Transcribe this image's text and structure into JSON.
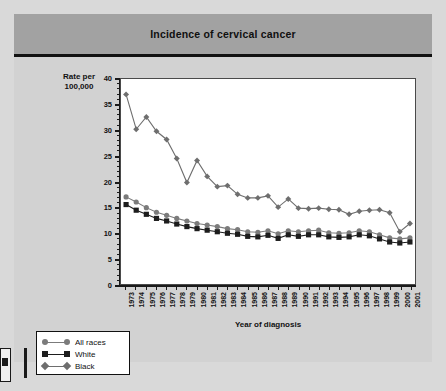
{
  "figure": {
    "title": "Incidence of cervical cancer",
    "title_bar_color": "#a2a2a2",
    "background_color": "#d9d9d9",
    "panel_color": "#d2d2d2",
    "plot_background": "#ffffff"
  },
  "axes": {
    "y_title_line1": "Rate per",
    "y_title_line2": "100,000",
    "x_title": "Year of diagnosis"
  },
  "legend": {
    "items": [
      {
        "label": "All races",
        "color": "#7b7b7b",
        "marker": "circle"
      },
      {
        "label": "White",
        "color": "#1d1d1d",
        "marker": "square"
      },
      {
        "label": "Black",
        "color": "#6e6e6e",
        "marker": "diamond"
      }
    ]
  },
  "chart_data": {
    "type": "line",
    "title": "Incidence of cervical cancer",
    "xlabel": "Year of diagnosis",
    "ylabel": "Rate per 100,000",
    "xlim": [
      1973,
      2001
    ],
    "ylim": [
      0,
      40
    ],
    "ytick_major_step": 5,
    "ytick_minor_step": 1,
    "yticks": [
      0,
      5,
      10,
      15,
      20,
      25,
      30,
      35,
      40
    ],
    "grid": false,
    "legend_position": "bottom-left-outside",
    "categories": [
      "1973",
      "1974",
      "1975",
      "1976",
      "1977",
      "1978",
      "1979",
      "1980",
      "1981",
      "1982",
      "1983",
      "1984",
      "1985",
      "1986",
      "1987",
      "1988",
      "1989",
      "1990",
      "1991",
      "1992",
      "1993",
      "1994",
      "1995",
      "1996",
      "1997",
      "1998",
      "1999",
      "2000",
      "2001"
    ],
    "series": [
      {
        "name": "Black",
        "color": "#6e6e6e",
        "marker": "diamond",
        "values": [
          37.0,
          30.2,
          32.6,
          29.8,
          28.2,
          24.5,
          19.8,
          24.1,
          21.0,
          19.0,
          19.2,
          17.5,
          16.8,
          16.8,
          17.2,
          15.0,
          16.6,
          14.8,
          14.7,
          14.8,
          14.6,
          14.5,
          13.6,
          14.2,
          14.4,
          14.5,
          13.9,
          10.2,
          11.8
        ]
      },
      {
        "name": "All races",
        "color": "#7b7b7b",
        "marker": "circle",
        "values": [
          17.0,
          16.0,
          14.9,
          14.0,
          13.4,
          12.8,
          12.3,
          11.8,
          11.5,
          11.2,
          10.8,
          10.6,
          10.2,
          10.1,
          10.4,
          9.8,
          10.4,
          10.2,
          10.4,
          10.5,
          10.0,
          9.9,
          10.0,
          10.4,
          10.2,
          9.6,
          9.0,
          8.8,
          9.0
        ]
      },
      {
        "name": "White",
        "color": "#1d1d1d",
        "marker": "square",
        "values": [
          15.5,
          14.4,
          13.6,
          12.8,
          12.3,
          11.7,
          11.2,
          10.8,
          10.5,
          10.2,
          9.9,
          9.7,
          9.3,
          9.2,
          9.5,
          8.9,
          9.6,
          9.3,
          9.6,
          9.6,
          9.2,
          9.1,
          9.2,
          9.6,
          9.4,
          8.8,
          8.2,
          8.0,
          8.2
        ]
      }
    ]
  }
}
